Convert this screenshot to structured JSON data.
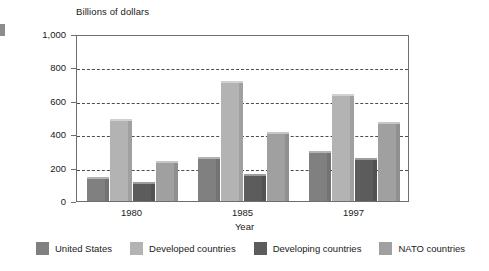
{
  "chart_data": {
    "type": "bar",
    "title": "",
    "ylabel": "Billions of dollars",
    "xlabel": "Year",
    "categories": [
      "1980",
      "1985",
      "1997"
    ],
    "ylim": [
      0,
      1000
    ],
    "yticks": [
      0,
      200,
      400,
      600,
      800,
      1000
    ],
    "ytick_labels": [
      "0",
      "200",
      "400",
      "600",
      "800",
      "1,000"
    ],
    "grid": true,
    "legend_position": "bottom",
    "series": [
      {
        "name": "United States",
        "color": "#808080",
        "values": [
          145,
          265,
          300
        ]
      },
      {
        "name": "Developed countries",
        "color": "#b3b3b3",
        "values": [
          490,
          720,
          640
        ]
      },
      {
        "name": "Developing countries",
        "color": "#5c5c5c",
        "values": [
          115,
          160,
          255
        ]
      },
      {
        "name": "NATO countries",
        "color": "#a0a0a0",
        "values": [
          240,
          415,
          475
        ]
      }
    ]
  },
  "axis": {
    "y_title": "Billions of dollars",
    "x_title": "Year"
  },
  "colors": {
    "frame": "#6e6e6e",
    "gridline": "#4d4d4d",
    "text": "#1a1a1a",
    "background": "#ffffff"
  }
}
